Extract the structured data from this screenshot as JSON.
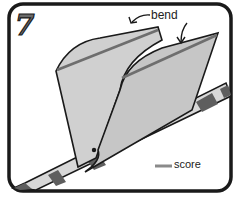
{
  "figure": {
    "step_number": "7",
    "labels": {
      "bend": "bend",
      "score": "score"
    },
    "legend": {
      "score_line_color": "#8a8a8a",
      "score_text": "score"
    },
    "colors": {
      "frame": "#1a1a1a",
      "paper_light": "#d4d4d4",
      "paper_mid": "#c4c4c4",
      "fold_line": "#6e6e6e",
      "stripe_dark": "#5e5e5e",
      "stripe_light": "#d8d8d8",
      "background": "#ffffff"
    }
  }
}
